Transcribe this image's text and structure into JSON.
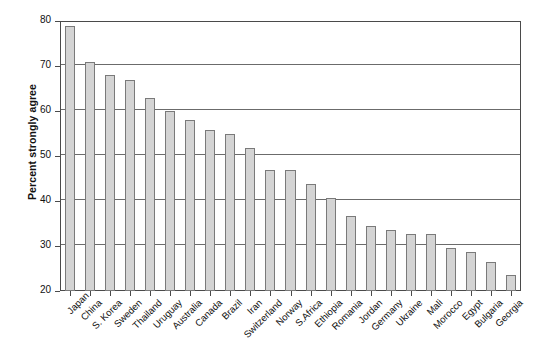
{
  "chart_data": {
    "type": "bar",
    "title": "",
    "subtitle": "",
    "xlabel": "",
    "ylabel": "Percent strongly agree",
    "ylim": [
      20,
      80
    ],
    "yticks": [
      20,
      30,
      40,
      50,
      60,
      70,
      80
    ],
    "ytick_labels": [
      "20",
      "30",
      "40",
      "50",
      "60",
      "70",
      "80"
    ],
    "grid": true,
    "legend": false,
    "legend_position": "none",
    "bar_color": "#d4d4d4",
    "bar_edge_color": "#7a7a7a",
    "axis_color": "#4a4a4a",
    "gridline_color": "#6b6b6b",
    "categories": [
      "Japan",
      "China",
      "S. Korea",
      "Sweden",
      "Thailand",
      "Uruguay",
      "Australia",
      "Canada",
      "Brazil",
      "Iran",
      "Switzerland",
      "Norway",
      "S.Africa",
      "Ethiopia",
      "Romania",
      "Jordan",
      "Germany",
      "Ukraine",
      "Mali",
      "Morocco",
      "Egypt",
      "Bulgaria",
      "Georgia"
    ],
    "values": [
      79.0,
      71.0,
      68.0,
      67.0,
      62.8,
      60.0,
      58.0,
      55.8,
      55.0,
      51.8,
      46.8,
      46.8,
      43.8,
      40.7,
      36.7,
      34.5,
      33.6,
      32.6,
      32.6,
      29.6,
      28.6,
      26.5,
      23.5
    ]
  }
}
